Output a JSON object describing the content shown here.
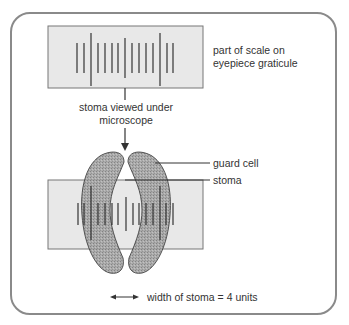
{
  "diagram": {
    "labels": {
      "scale_line1": "part of scale on",
      "scale_line2": "eyepiece graticule",
      "viewed_line1": "stoma viewed under",
      "viewed_line2": "microscope",
      "guard_cell": "guard cell",
      "stoma": "stoma",
      "legend": "width of stoma = 4 units"
    },
    "scale": {
      "tick_count": 15,
      "long_tick_indices": [
        2,
        12
      ],
      "medium_tick_indices": [
        7
      ]
    },
    "colors": {
      "border": "#8a8a8a",
      "scale_fill": "#e8e8e8",
      "guard_cell_fill": "#9a9a9a",
      "ink": "#333333"
    },
    "measurement": {
      "stoma_width_units": 4
    }
  }
}
